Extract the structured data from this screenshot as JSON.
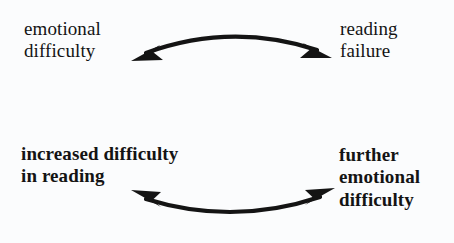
{
  "diagram": {
    "background_color": "#fbfcfd",
    "ink_color": "#141414",
    "nodes": [
      {
        "id": "emotional-difficulty",
        "position": "top-left",
        "text": "emotional\ndifficulty",
        "lines": [
          "emotional",
          "difficulty"
        ],
        "weight": "regular"
      },
      {
        "id": "reading-failure",
        "position": "top-right",
        "text": "reading\nfailure",
        "lines": [
          "reading",
          "failure"
        ],
        "weight": "regular"
      },
      {
        "id": "increased-difficulty-in-reading",
        "position": "bottom-left",
        "text": "increased difficulty\nin reading",
        "lines": [
          "increased difficulty",
          "in reading"
        ],
        "weight": "bold"
      },
      {
        "id": "further-emotional-difficulty",
        "position": "bottom-right",
        "text": "further\nemotional\ndifficulty",
        "lines": [
          "further",
          "emotional",
          "difficulty"
        ],
        "weight": "bold"
      }
    ],
    "connectors": [
      {
        "id": "top-connector",
        "style": "double-headed-curved-arrow",
        "curve": "arc convex upward",
        "from": "emotional-difficulty",
        "to": "reading-failure",
        "head_left": "arrowhead pointing down-left",
        "head_right": "arrowhead pointing down-right"
      },
      {
        "id": "bottom-connector",
        "style": "double-headed-curved-arrow",
        "curve": "arc concave upward",
        "from": "further-emotional-difficulty",
        "to": "increased-difficulty-in-reading",
        "head_left": "arrowhead pointing up-left",
        "head_right": "arrowhead pointing up-right"
      }
    ]
  }
}
